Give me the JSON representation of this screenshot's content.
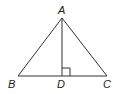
{
  "diagram": {
    "type": "triangle-with-altitude",
    "points": {
      "A": {
        "label": "A",
        "x": 62,
        "y": 18
      },
      "B": {
        "label": "B",
        "x": 18,
        "y": 76
      },
      "C": {
        "label": "C",
        "x": 107,
        "y": 76
      },
      "D": {
        "label": "D",
        "x": 62,
        "y": 76
      }
    },
    "segments": [
      "AB",
      "AC",
      "BC",
      "AD"
    ],
    "right_angle_at": "D",
    "line_color": "#333333"
  }
}
